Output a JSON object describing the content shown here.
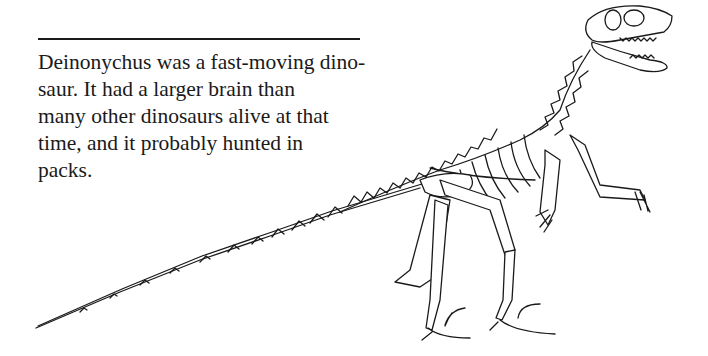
{
  "caption": {
    "lines": [
      "Deinonychus was a fast-moving dino-",
      "saur. It had a larger brain than",
      "many other dinosaurs alive at that",
      "time, and it probably hunted in",
      "packs."
    ]
  },
  "illustration": {
    "subject": "Deinonychus skeleton",
    "style": "black line drawing"
  },
  "colors": {
    "ink": "#1a1a1a",
    "paper": "#ffffff"
  }
}
